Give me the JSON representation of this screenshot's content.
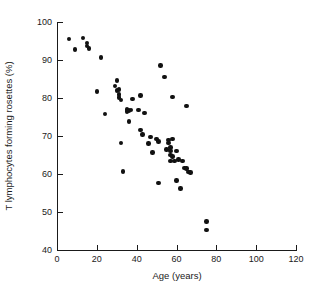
{
  "chart_data": {
    "type": "scatter",
    "title": "",
    "xlabel": "Age (years)",
    "ylabel": "T lymphocytes forming rosettes (%)",
    "xlim": [
      0,
      120
    ],
    "ylim": [
      40,
      100
    ],
    "xticks": [
      0,
      20,
      40,
      60,
      80,
      100,
      120
    ],
    "yticks": [
      40,
      50,
      60,
      70,
      80,
      90,
      100
    ],
    "xtick_labels": [
      "0",
      "20",
      "40",
      "60",
      "80",
      "100",
      "120"
    ],
    "ytick_labels": [
      "40",
      "50",
      "60",
      "70",
      "80",
      "90",
      "100"
    ],
    "grid": false,
    "legend": false,
    "marker": "filled-circle",
    "marker_color": "#111111",
    "points": [
      {
        "x": 6,
        "y": 95.5
      },
      {
        "x": 9,
        "y": 92.8
      },
      {
        "x": 13,
        "y": 95.8
      },
      {
        "x": 15,
        "y": 94.5
      },
      {
        "x": 15,
        "y": 93.7
      },
      {
        "x": 16,
        "y": 93.0
      },
      {
        "x": 20,
        "y": 81.7
      },
      {
        "x": 22,
        "y": 90.7
      },
      {
        "x": 24,
        "y": 75.8
      },
      {
        "x": 29,
        "y": 83.1
      },
      {
        "x": 30,
        "y": 84.6
      },
      {
        "x": 30,
        "y": 82.0
      },
      {
        "x": 31,
        "y": 82.2
      },
      {
        "x": 31,
        "y": 80.9
      },
      {
        "x": 31,
        "y": 80.1
      },
      {
        "x": 32,
        "y": 79.4
      },
      {
        "x": 32,
        "y": 68.2
      },
      {
        "x": 33,
        "y": 60.7
      },
      {
        "x": 35,
        "y": 77.0
      },
      {
        "x": 35,
        "y": 76.5
      },
      {
        "x": 36,
        "y": 76.7
      },
      {
        "x": 36,
        "y": 73.8
      },
      {
        "x": 37,
        "y": 76.8
      },
      {
        "x": 38,
        "y": 79.8
      },
      {
        "x": 41,
        "y": 76.9
      },
      {
        "x": 42,
        "y": 80.7
      },
      {
        "x": 42,
        "y": 71.6
      },
      {
        "x": 43,
        "y": 70.4
      },
      {
        "x": 44,
        "y": 76.0
      },
      {
        "x": 46,
        "y": 68.0
      },
      {
        "x": 47,
        "y": 69.7
      },
      {
        "x": 48,
        "y": 65.7
      },
      {
        "x": 50,
        "y": 69.2
      },
      {
        "x": 51,
        "y": 68.6
      },
      {
        "x": 51,
        "y": 57.6
      },
      {
        "x": 52,
        "y": 88.6
      },
      {
        "x": 54,
        "y": 85.6
      },
      {
        "x": 55,
        "y": 66.5
      },
      {
        "x": 56,
        "y": 69.0
      },
      {
        "x": 56,
        "y": 68.1
      },
      {
        "x": 57,
        "y": 67.0
      },
      {
        "x": 57,
        "y": 66.1
      },
      {
        "x": 57,
        "y": 65.0
      },
      {
        "x": 57,
        "y": 63.5
      },
      {
        "x": 58,
        "y": 80.3
      },
      {
        "x": 58,
        "y": 69.2
      },
      {
        "x": 58,
        "y": 64.6
      },
      {
        "x": 59,
        "y": 63.4
      },
      {
        "x": 60,
        "y": 66.0
      },
      {
        "x": 60,
        "y": 58.3
      },
      {
        "x": 61,
        "y": 63.8
      },
      {
        "x": 62,
        "y": 56.2
      },
      {
        "x": 63,
        "y": 63.4
      },
      {
        "x": 64,
        "y": 61.6
      },
      {
        "x": 65,
        "y": 77.9
      },
      {
        "x": 65,
        "y": 61.4
      },
      {
        "x": 66,
        "y": 60.5
      },
      {
        "x": 67,
        "y": 60.4
      },
      {
        "x": 75,
        "y": 47.5
      },
      {
        "x": 75,
        "y": 45.2
      }
    ]
  }
}
